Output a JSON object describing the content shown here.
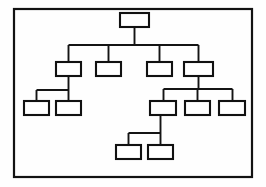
{
  "diagram": {
    "type": "org-chart",
    "frame": {
      "x": 14,
      "y": 9,
      "width": 238,
      "height": 168,
      "stroke_color": "#121212",
      "fill_color": "#ffffff"
    },
    "style": {
      "node_fill": "#ffffff",
      "node_stroke": "#111111",
      "connector_stroke": "#141414",
      "background": "#fefefe"
    },
    "levels": [
      {
        "index": 0,
        "name": "root-level",
        "node_count": 1
      },
      {
        "index": 1,
        "name": "second-level",
        "node_count": 4
      },
      {
        "index": 2,
        "name": "third-level",
        "node_count": 5
      },
      {
        "index": 3,
        "name": "fourth-level",
        "node_count": 2
      }
    ],
    "nodes": [
      {
        "id": "n0",
        "label": "",
        "level": 0,
        "x": 120,
        "y": 13,
        "width": 29,
        "height": 14,
        "parent": null
      },
      {
        "id": "n1",
        "label": "",
        "level": 1,
        "x": 56,
        "y": 62,
        "width": 25,
        "height": 14,
        "parent": "n0"
      },
      {
        "id": "n2",
        "label": "",
        "level": 1,
        "x": 96,
        "y": 62,
        "width": 25,
        "height": 14,
        "parent": "n0"
      },
      {
        "id": "n3",
        "label": "",
        "level": 1,
        "x": 147,
        "y": 62,
        "width": 25,
        "height": 14,
        "parent": "n0"
      },
      {
        "id": "n4",
        "label": "",
        "level": 1,
        "x": 184,
        "y": 62,
        "width": 29,
        "height": 14,
        "parent": "n0"
      },
      {
        "id": "n5",
        "label": "",
        "level": 2,
        "x": 24,
        "y": 101,
        "width": 25,
        "height": 14,
        "parent": "n1"
      },
      {
        "id": "n6",
        "label": "",
        "level": 2,
        "x": 56,
        "y": 101,
        "width": 25,
        "height": 14,
        "parent": "n1"
      },
      {
        "id": "n7",
        "label": "",
        "level": 2,
        "x": 150,
        "y": 101,
        "width": 26,
        "height": 14,
        "parent": "n4"
      },
      {
        "id": "n8",
        "label": "",
        "level": 2,
        "x": 185,
        "y": 101,
        "width": 25,
        "height": 14,
        "parent": "n4"
      },
      {
        "id": "n9",
        "label": "",
        "level": 2,
        "x": 219,
        "y": 101,
        "width": 26,
        "height": 14,
        "parent": "n4"
      },
      {
        "id": "n10",
        "label": "",
        "level": 3,
        "x": 116,
        "y": 145,
        "width": 25,
        "height": 14,
        "parent": "n7"
      },
      {
        "id": "n11",
        "label": "",
        "level": 3,
        "x": 148,
        "y": 145,
        "width": 25,
        "height": 14,
        "parent": "n7"
      }
    ],
    "connectors": [
      {
        "id": "c-root-drop",
        "name": "root-drop-stem",
        "d": "M 134.5 27 L 134.5 45"
      },
      {
        "id": "c-level1-bus",
        "name": "level1-horizontal-bus",
        "d": "M 68.5 45 L 198.5 45"
      },
      {
        "id": "c-n1-stem",
        "name": "node1-riser",
        "d": "M 68.5 45 L 68.5 62"
      },
      {
        "id": "c-n2-stem",
        "name": "node2-riser",
        "d": "M 108.5 45 L 108.5 62"
      },
      {
        "id": "c-n3-stem",
        "name": "node3-riser",
        "d": "M 159.5 45 L 159.5 62"
      },
      {
        "id": "c-n4-stem",
        "name": "node4-riser",
        "d": "M 198.5 45 L 198.5 62"
      },
      {
        "id": "c-n1-drop",
        "name": "node1-drop-stem",
        "d": "M 68.5 76 L 68.5 90"
      },
      {
        "id": "c-left-bus",
        "name": "left-horizontal-bus",
        "d": "M 36.5 90 L 68.5 90"
      },
      {
        "id": "c-n5-stem",
        "name": "node5-riser",
        "d": "M 36.5 90 L 36.5 101"
      },
      {
        "id": "c-n6-stem",
        "name": "node6-riser",
        "d": "M 68.5 90 L 68.5 101"
      },
      {
        "id": "c-n4-drop",
        "name": "node4-drop-stem",
        "d": "M 198.5 76 L 198.5 89"
      },
      {
        "id": "c-right-bus",
        "name": "right-horizontal-bus",
        "d": "M 163.5 89 L 232.5 89"
      },
      {
        "id": "c-n7-stem",
        "name": "node7-riser",
        "d": "M 163.5 89 L 163.5 101"
      },
      {
        "id": "c-n8-stem",
        "name": "node8-riser",
        "d": "M 197.5 89 L 197.5 101"
      },
      {
        "id": "c-n9-stem",
        "name": "node9-riser",
        "d": "M 232.5 89 L 232.5 101"
      },
      {
        "id": "c-n7-drop",
        "name": "node7-drop-stem",
        "d": "M 160.5 115 L 160.5 133"
      },
      {
        "id": "c-bottom-bus",
        "name": "bottom-horizontal-bus",
        "d": "M 128.5 133 L 160.5 133"
      },
      {
        "id": "c-n10-stem",
        "name": "node10-riser",
        "d": "M 128.5 133 L 128.5 145"
      },
      {
        "id": "c-n11-stem",
        "name": "node11-riser",
        "d": "M 160.5 133 L 160.5 145"
      }
    ]
  }
}
